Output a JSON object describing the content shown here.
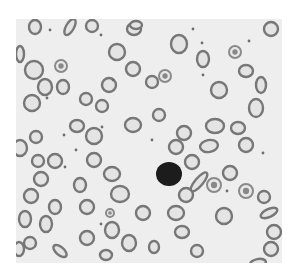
{
  "image": {
    "subject": "peripheral blood smear micrograph",
    "colors": {
      "page_background": "#ffffff",
      "slide_background": "#eeeeee",
      "rbc_membrane": "#777777",
      "rbc_center": "#e4e4e4",
      "platelet": "#6e6e6e",
      "lymphocyte": "#1a1a1a"
    },
    "frame": {
      "x": 16,
      "y": 19,
      "width": 266,
      "height": 244
    },
    "lymphocyte": {
      "cx": 153,
      "cy": 155,
      "r": 13
    },
    "red_cells": [
      [
        19,
        8,
        6,
        7,
        0
      ],
      [
        54,
        8,
        4,
        9,
        30
      ],
      [
        76,
        7,
        6,
        6,
        0
      ],
      [
        118,
        10,
        7,
        6,
        0
      ],
      [
        120,
        6,
        6,
        4,
        0
      ],
      [
        255,
        10,
        7,
        7,
        0
      ],
      [
        4,
        35,
        4,
        8,
        0
      ],
      [
        18,
        51,
        9,
        9,
        0
      ],
      [
        101,
        33,
        8,
        8,
        0
      ],
      [
        117,
        50,
        7,
        7,
        0
      ],
      [
        163,
        25,
        8,
        9,
        0
      ],
      [
        187,
        40,
        6,
        8,
        0
      ],
      [
        230,
        52,
        7,
        6,
        0
      ],
      [
        245,
        66,
        5,
        8,
        0
      ],
      [
        29,
        68,
        7,
        8,
        0
      ],
      [
        47,
        68,
        6,
        7,
        0
      ],
      [
        93,
        66,
        7,
        7,
        0
      ],
      [
        136,
        63,
        6,
        6,
        0
      ],
      [
        203,
        71,
        8,
        8,
        0
      ],
      [
        16,
        84,
        8,
        8,
        0
      ],
      [
        70,
        80,
        6,
        6,
        0
      ],
      [
        86,
        87,
        6,
        6,
        0
      ],
      [
        240,
        89,
        7,
        9,
        0
      ],
      [
        61,
        107,
        7,
        6,
        0
      ],
      [
        117,
        106,
        8,
        7,
        0
      ],
      [
        143,
        96,
        6,
        6,
        0
      ],
      [
        168,
        114,
        7,
        7,
        0
      ],
      [
        199,
        107,
        9,
        7,
        0
      ],
      [
        222,
        109,
        7,
        6,
        0
      ],
      [
        4,
        129,
        7,
        8,
        0
      ],
      [
        20,
        118,
        6,
        6,
        0
      ],
      [
        78,
        117,
        8,
        8,
        0
      ],
      [
        160,
        128,
        7,
        7,
        0
      ],
      [
        193,
        127,
        9,
        6,
        -10
      ],
      [
        230,
        126,
        7,
        7,
        0
      ],
      [
        22,
        142,
        6,
        6,
        0
      ],
      [
        39,
        142,
        7,
        7,
        0
      ],
      [
        78,
        141,
        7,
        7,
        0
      ],
      [
        176,
        143,
        7,
        7,
        0
      ],
      [
        214,
        154,
        7,
        7,
        0
      ],
      [
        25,
        160,
        7,
        7,
        0
      ],
      [
        96,
        155,
        8,
        7,
        0
      ],
      [
        183,
        163,
        4,
        12,
        40
      ],
      [
        248,
        178,
        6,
        6,
        0
      ],
      [
        15,
        177,
        7,
        7,
        0
      ],
      [
        64,
        166,
        6,
        7,
        0
      ],
      [
        104,
        175,
        9,
        8,
        0
      ],
      [
        170,
        176,
        7,
        7,
        0
      ],
      [
        160,
        194,
        8,
        7,
        0
      ],
      [
        39,
        188,
        6,
        7,
        0
      ],
      [
        71,
        188,
        7,
        7,
        0
      ],
      [
        127,
        194,
        7,
        7,
        0
      ],
      [
        208,
        197,
        8,
        8,
        0
      ],
      [
        253,
        194,
        9,
        4,
        -25
      ],
      [
        9,
        200,
        6,
        8,
        0
      ],
      [
        30,
        205,
        6,
        8,
        0
      ],
      [
        96,
        211,
        7,
        8,
        0
      ],
      [
        166,
        213,
        7,
        6,
        0
      ],
      [
        258,
        213,
        7,
        7,
        0
      ],
      [
        14,
        224,
        6,
        6,
        0
      ],
      [
        71,
        219,
        7,
        7,
        0
      ],
      [
        113,
        224,
        7,
        8,
        0
      ],
      [
        138,
        228,
        5,
        6,
        0
      ],
      [
        181,
        232,
        6,
        6,
        0
      ],
      [
        255,
        230,
        7,
        7,
        0
      ],
      [
        3,
        230,
        5,
        7,
        0
      ],
      [
        44,
        232,
        8,
        4,
        40
      ],
      [
        90,
        236,
        6,
        5,
        0
      ],
      [
        242,
        244,
        8,
        4,
        -10
      ]
    ],
    "crenated_cells": [
      [
        45,
        47,
        6
      ],
      [
        149,
        57,
        6
      ],
      [
        219,
        33,
        6
      ],
      [
        94,
        194,
        4
      ],
      [
        198,
        166,
        7
      ],
      [
        230,
        172,
        7
      ]
    ],
    "platelets": [
      [
        34,
        11
      ],
      [
        85,
        16
      ],
      [
        177,
        10
      ],
      [
        31,
        79
      ],
      [
        86,
        108
      ],
      [
        48,
        116
      ],
      [
        49,
        148
      ],
      [
        60,
        131
      ],
      [
        186,
        24
      ],
      [
        187,
        56
      ],
      [
        233,
        22
      ],
      [
        247,
        134
      ],
      [
        211,
        172
      ],
      [
        85,
        205
      ],
      [
        136,
        121
      ],
      [
        97,
        61
      ]
    ]
  }
}
